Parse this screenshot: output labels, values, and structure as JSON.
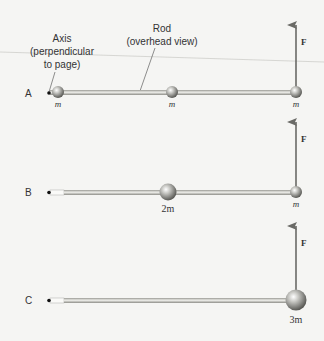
{
  "labels": {
    "axis_line1": "Axis",
    "axis_line2": "(perpendicular",
    "axis_line3": "to page)",
    "rod_line1": "Rod",
    "rod_line2": "(overhead view)",
    "force": "F"
  },
  "rows": [
    {
      "id": "A",
      "label": "A",
      "masses": [
        {
          "label": "m",
          "position": "axis end"
        },
        {
          "label": "m",
          "position": "middle"
        },
        {
          "label": "m",
          "position": "far end"
        }
      ]
    },
    {
      "id": "B",
      "label": "B",
      "masses": [
        {
          "label": "2m",
          "position": "middle"
        },
        {
          "label": "m",
          "position": "far end"
        }
      ]
    },
    {
      "id": "C",
      "label": "C",
      "masses": [
        {
          "label": "3m",
          "position": "far end"
        }
      ]
    }
  ],
  "colors": {
    "rod": "#b8b8b2",
    "rod_highlight": "#e8e8e4",
    "sphere": "#8a8a86",
    "arrow": "#6a6a66",
    "text": "#333333"
  }
}
